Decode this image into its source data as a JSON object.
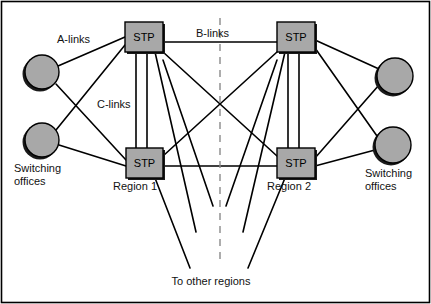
{
  "figure": {
    "border_color": "#000000",
    "background": "#ffffff"
  },
  "style": {
    "node_fill": "#a8a8a8",
    "node_stroke": "#000000",
    "shadow_color": "#1a1a1a",
    "link_color": "#000000",
    "divider_color": "#808080",
    "text_color": "#111111"
  },
  "nodes": {
    "stp": [
      {
        "id": "stp-top-left",
        "label": "STP",
        "x": 125,
        "y": 22,
        "w": 38,
        "h": 30
      },
      {
        "id": "stp-top-right",
        "label": "STP",
        "x": 277,
        "y": 22,
        "w": 38,
        "h": 30
      },
      {
        "id": "stp-bottom-left",
        "label": "STP",
        "x": 126,
        "y": 148,
        "w": 37,
        "h": 30
      },
      {
        "id": "stp-bottom-right",
        "label": "STP",
        "x": 277,
        "y": 148,
        "w": 38,
        "h": 30
      }
    ],
    "switching_offices": [
      {
        "id": "so-left-top",
        "cx": 42,
        "cy": 72,
        "r": 17
      },
      {
        "id": "so-left-bottom",
        "cx": 42,
        "cy": 140,
        "r": 17
      },
      {
        "id": "so-right-top",
        "cx": 395,
        "cy": 76,
        "r": 18
      },
      {
        "id": "so-right-bottom",
        "cx": 393,
        "cy": 145,
        "r": 18
      }
    ]
  },
  "labels": {
    "a_links": "A-links",
    "b_links": "B-links",
    "c_links": "C-links",
    "region_1": "Region 1",
    "region_2": "Region 2",
    "switching_offices_left": [
      "Switching",
      "offices"
    ],
    "switching_offices_right": [
      "Switching",
      "offices"
    ],
    "to_other_regions": "To other regions"
  },
  "link_types": [
    {
      "name": "A-links",
      "description": "switching office to STP"
    },
    {
      "name": "B-links",
      "description": "STP to STP across regions"
    },
    {
      "name": "C-links",
      "description": "mated STP pair within a region"
    }
  ]
}
